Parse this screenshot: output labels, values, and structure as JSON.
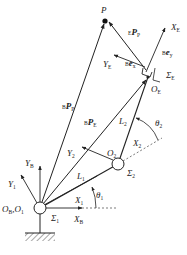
{
  "diagram": {
    "title": "",
    "type": "two-link planar manipulator with coordinate frames",
    "colors": {
      "stroke": "#222222",
      "background": "#ffffff"
    },
    "points": {
      "P": {
        "label": "P"
      },
      "O_B_O_1": {
        "label": "O",
        "sub1": "B",
        "sep": ",O",
        "sub2": "1"
      },
      "O_2": {
        "label": "O",
        "sub": "2"
      },
      "O_E": {
        "label": "O",
        "sub": "E"
      }
    },
    "frames": {
      "sigma_1": {
        "label": "Σ",
        "sub": "1"
      },
      "sigma_2": {
        "label": "Σ",
        "sub": "2"
      },
      "sigma_E": {
        "label": "Σ",
        "sub": "E"
      }
    },
    "axes": {
      "X_B": {
        "label": "X",
        "sub": "B"
      },
      "Y_B": {
        "label": "Y",
        "sub": "B"
      },
      "X_1": {
        "label": "X",
        "sub": "1"
      },
      "Y_1": {
        "label": "Y",
        "sub": "1"
      },
      "X_2": {
        "label": "X",
        "sub": "2"
      },
      "Y_2": {
        "label": "Y",
        "sub": "2"
      },
      "X_E": {
        "label": "X",
        "sub": "E"
      },
      "Y_E": {
        "label": "Y",
        "sub": "E"
      }
    },
    "links": {
      "L_1": {
        "label": "L",
        "sub": "1"
      },
      "L_2": {
        "label": "L",
        "sub": "2"
      }
    },
    "angles": {
      "theta_1": {
        "label": "θ",
        "sub": "1"
      },
      "theta_2": {
        "label": "θ",
        "sub": "2"
      }
    },
    "vectors": {
      "B_P_P": {
        "sup": "B",
        "label": "P",
        "sub": "P"
      },
      "B_P_E": {
        "sup": "B",
        "label": "P",
        "sub": "E"
      },
      "E_P_P": {
        "sup": "E",
        "label": "P",
        "sub": "P"
      },
      "B_e_x": {
        "sup": "B",
        "label": "e",
        "sub": "x"
      },
      "B_e_y": {
        "sup": "B",
        "label": "e",
        "sub": "y"
      }
    }
  }
}
